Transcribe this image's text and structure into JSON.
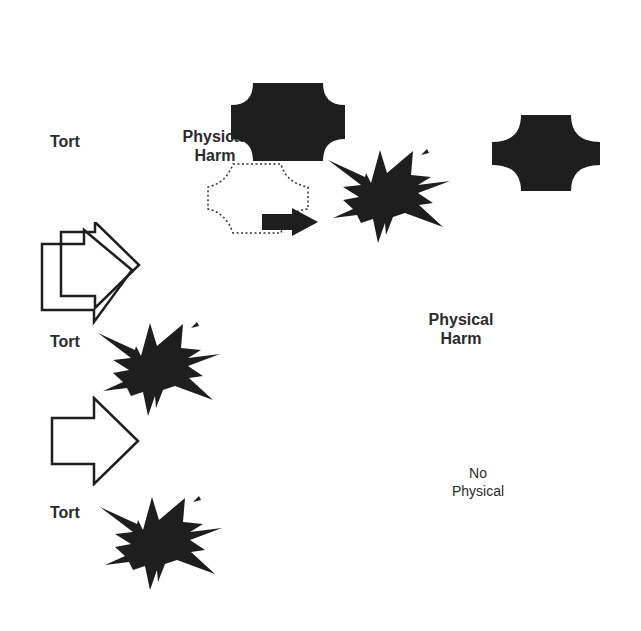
{
  "diagram": {
    "colors": {
      "fill": "#1e1e1e",
      "stroke": "#1e1e1e",
      "text": "#2b2b2b",
      "background": "#ffffff"
    },
    "labels": {
      "tort_top": "Tort",
      "physical_harm_top": "Physical\nHarm",
      "tort_middle": "Tort",
      "physical_harm_right": "Physical\nHarm",
      "tort_bottom": "Tort",
      "no_physical": "No\nPhysical"
    },
    "shapes": [
      {
        "id": "plaque-top-center",
        "kind": "plaque",
        "style": "filled"
      },
      {
        "id": "plaque-top-right",
        "kind": "plaque",
        "style": "filled"
      },
      {
        "id": "plaque-dotted",
        "kind": "plaque",
        "style": "dotted-outline"
      },
      {
        "id": "small-arrow",
        "kind": "block-arrow",
        "style": "filled"
      },
      {
        "id": "explosion-top",
        "kind": "explosion",
        "style": "filled"
      },
      {
        "id": "double-arrow-left",
        "kind": "block-arrow",
        "style": "outline",
        "count": 2
      },
      {
        "id": "explosion-middle",
        "kind": "explosion",
        "style": "filled"
      },
      {
        "id": "arrow-lower-left",
        "kind": "block-arrow",
        "style": "outline"
      },
      {
        "id": "explosion-bottom",
        "kind": "explosion",
        "style": "filled"
      }
    ]
  }
}
